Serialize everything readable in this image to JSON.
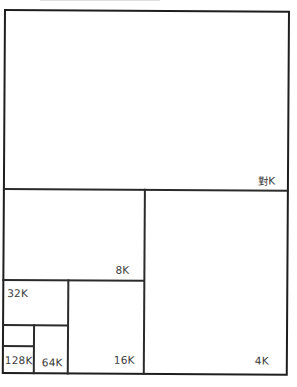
{
  "diagram": {
    "type": "memory-partition-treemap",
    "colors": {
      "line": "#2b2b2b",
      "background": "#ffffff",
      "text": "#3a3a3a"
    },
    "regions": [
      {
        "id": "top",
        "label": "對K"
      },
      {
        "id": "right-lower",
        "label": "4K"
      },
      {
        "id": "left-upper",
        "label": "8K"
      },
      {
        "id": "middle-lower",
        "label": "16K"
      },
      {
        "id": "left-mid",
        "label": "32K"
      },
      {
        "id": "small-right",
        "label": "64K"
      },
      {
        "id": "small-bottom",
        "label": "128K"
      }
    ]
  }
}
